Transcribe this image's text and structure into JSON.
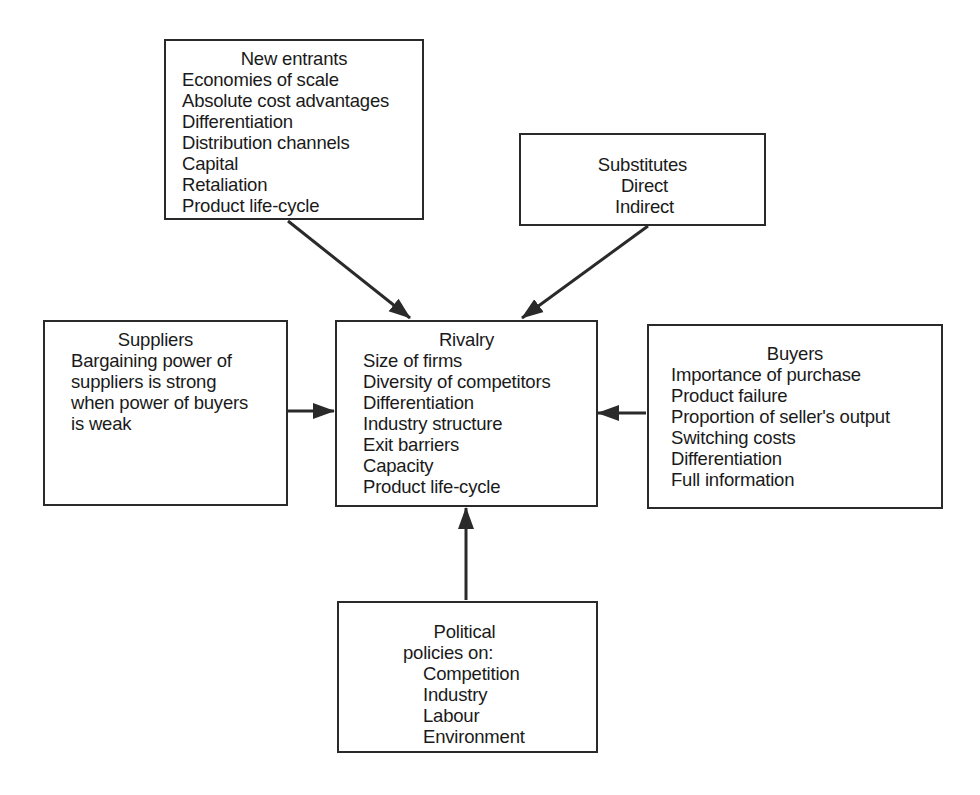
{
  "diagram": {
    "type": "five-forces-style influence diagram",
    "colors": {
      "line": "#2a2a2a",
      "text": "#1a1a1a",
      "background": "#ffffff"
    },
    "center": {
      "title": "Rivalry",
      "items": [
        "Size of firms",
        "Diversity of competitors",
        "Differentiation",
        "Industry structure",
        "Exit barriers",
        "Capacity",
        "Product life-cycle"
      ]
    },
    "new_entrants": {
      "title": "New entrants",
      "items": [
        "Economies of scale",
        "Absolute cost advantages",
        "Differentiation",
        "Distribution channels",
        "Capital",
        "Retaliation",
        "Product life-cycle"
      ]
    },
    "substitutes": {
      "title": "Substitutes",
      "items": [
        "Direct",
        "Indirect"
      ]
    },
    "suppliers": {
      "title": "Suppliers",
      "items": [
        "Bargaining power of",
        "suppliers is strong",
        "when power of buyers",
        "is weak"
      ]
    },
    "buyers": {
      "title": "Buyers",
      "items": [
        "Importance of purchase",
        "Product failure",
        "Proportion of seller's output",
        "Switching costs",
        "Differentiation",
        "Full information"
      ]
    },
    "political": {
      "title": "Political",
      "subtitle": "policies on:",
      "items": [
        "Competition",
        "Industry",
        "Labour",
        "Environment"
      ]
    },
    "arrows": [
      {
        "from": "New entrants",
        "to": "Rivalry"
      },
      {
        "from": "Substitutes",
        "to": "Rivalry"
      },
      {
        "from": "Suppliers",
        "to": "Rivalry"
      },
      {
        "from": "Buyers",
        "to": "Rivalry"
      },
      {
        "from": "Political",
        "to": "Rivalry"
      }
    ]
  }
}
